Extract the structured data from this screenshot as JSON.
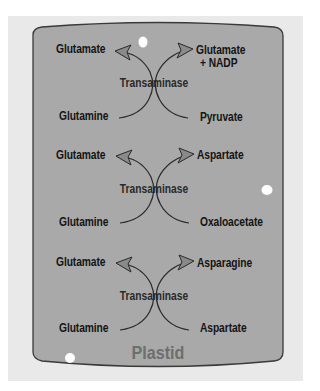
{
  "diagram": {
    "compartment_label": "Plastid",
    "colors": {
      "background": "#ffffff",
      "outer_panel": "#e9e9e9",
      "compartment_fill": "#a9a9a9",
      "compartment_border": "#3a3a3a",
      "text": "#141414",
      "arrow_stroke": "#2a2a2a",
      "arrowhead_fill": "#8a8a8a",
      "plastid_label": "#6e6e6e",
      "highlight_dots": "#ffffff"
    },
    "reactions": [
      {
        "enzyme": "Transaminase",
        "substrate_left": "Glutamine",
        "product_left": "Glutamate",
        "substrate_right": "Pyruvate",
        "product_right": "Glutamate",
        "product_right_extra": "+ NADP"
      },
      {
        "enzyme": "Transaminase",
        "substrate_left": "Glutamine",
        "product_left": "Glutamate",
        "substrate_right": "Oxaloacetate",
        "product_right": "Aspartate"
      },
      {
        "enzyme": "Transaminase",
        "substrate_left": "Glutamine",
        "product_left": "Glutamate",
        "substrate_right": "Aspartate",
        "product_right": "Asparagine"
      }
    ]
  }
}
